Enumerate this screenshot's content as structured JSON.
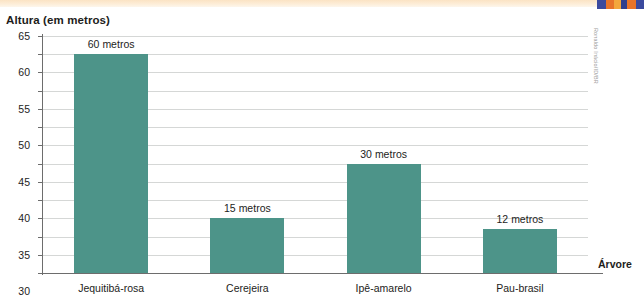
{
  "chart_title": "Altura (em metros)",
  "credit": "Ronaldo Inácio/ID/BR",
  "top_band": {
    "name": "decorative-band",
    "color": "#fbe3c4",
    "swatches": [
      {
        "color": "#3b4a9e",
        "width": 9
      },
      {
        "color": "#e8742a",
        "width": 8
      },
      {
        "color": "#f3a73c",
        "width": 7
      },
      {
        "color": "#2f3f8f",
        "width": 6
      },
      {
        "color": "#e8742a",
        "width": 9
      },
      {
        "color": "#3b4a9e",
        "width": 8
      }
    ]
  },
  "chart_data": {
    "type": "bar",
    "title": "Altura (em metros)",
    "xlabel": "Árvore",
    "ylabel": "Altura (em metros)",
    "categories": [
      "Jequitibá-rosa",
      "Cerejeira",
      "Ipê-amarelo",
      "Pau-brasil"
    ],
    "values": [
      60,
      15,
      30,
      12
    ],
    "value_labels": [
      "60 metros",
      "15 metros",
      "30 metros",
      "12 metros"
    ],
    "unit": "metros",
    "ylim": [
      0,
      65
    ],
    "ytick_step": 5,
    "yticks": [
      0,
      5,
      10,
      15,
      20,
      25,
      30,
      35,
      40,
      45,
      50,
      55,
      60,
      65
    ],
    "ytick_labels": [
      "0",
      "5",
      "10",
      "15",
      "20",
      "25",
      "30",
      "35",
      "40",
      "45",
      "50",
      "55",
      "60",
      "65"
    ],
    "grid": true,
    "grid_axis": "y",
    "legend": false,
    "bar_color": "#4d9489",
    "grid_color": "#d5d7d6",
    "axis_color": "#6d6d6d"
  }
}
